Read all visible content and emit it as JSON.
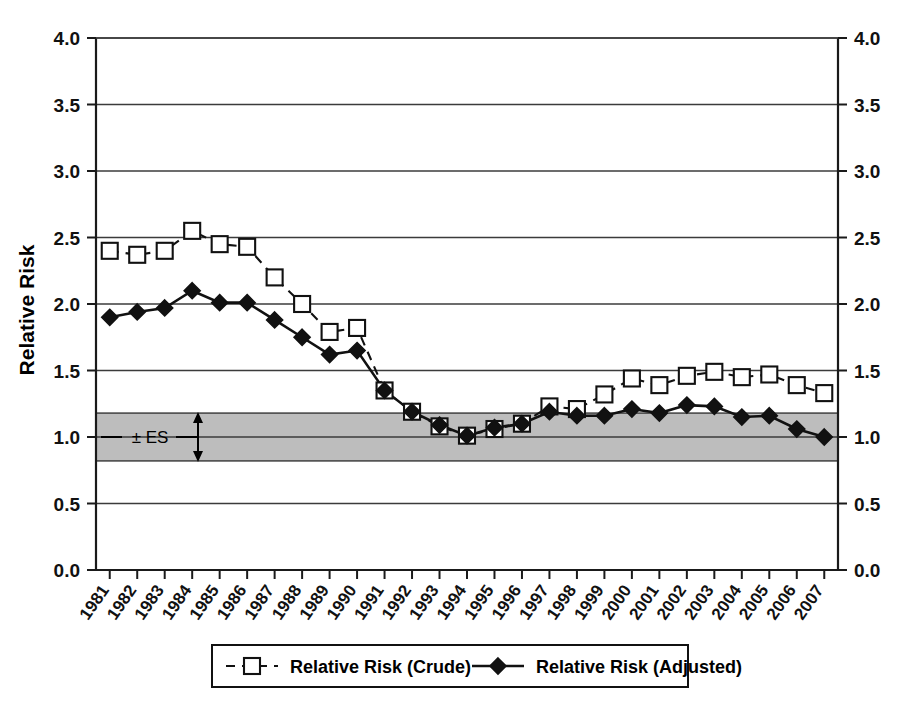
{
  "chart_data": {
    "type": "line",
    "title": "",
    "xlabel": "",
    "ylabel": "Relative Risk",
    "ylim": [
      0.0,
      4.0
    ],
    "ytick_values": [
      0.0,
      0.5,
      1.0,
      1.5,
      2.0,
      2.5,
      3.0,
      3.5,
      4.0
    ],
    "ytick_labels": [
      "0.0",
      "0.5",
      "1.0",
      "1.5",
      "2.0",
      "2.5",
      "3.0",
      "3.5",
      "4.0"
    ],
    "right_axis_labels": [
      "0.0",
      "0.5",
      "1.0",
      "1.5",
      "2.0",
      "2.5",
      "3.0",
      "3.5",
      "4.0"
    ],
    "grid": true,
    "legend_position": "bottom",
    "categories": [
      "1981",
      "1982",
      "1983",
      "1984",
      "1985",
      "1986",
      "1987",
      "1988",
      "1989",
      "1990",
      "1991",
      "1992",
      "1993",
      "1994",
      "1995",
      "1996",
      "1997",
      "1998",
      "1999",
      "2000",
      "2001",
      "2002",
      "2003",
      "2004",
      "2005",
      "2006",
      "2007"
    ],
    "series": [
      {
        "name": "Relative Risk (Crude)",
        "marker": "open-square",
        "linestyle": "dashed",
        "values": [
          2.4,
          2.37,
          2.4,
          2.55,
          2.45,
          2.43,
          2.2,
          2.0,
          1.79,
          1.82,
          1.35,
          1.19,
          1.08,
          1.01,
          1.06,
          1.1,
          1.23,
          1.21,
          1.32,
          1.44,
          1.39,
          1.46,
          1.49,
          1.45,
          1.47,
          1.39,
          1.33
        ]
      },
      {
        "name": "Relative Risk (Adjusted)",
        "marker": "filled-diamond",
        "linestyle": "solid",
        "values": [
          1.9,
          1.94,
          1.97,
          2.1,
          2.01,
          2.01,
          1.88,
          1.75,
          1.62,
          1.65,
          1.35,
          1.19,
          1.09,
          1.01,
          1.07,
          1.1,
          1.19,
          1.16,
          1.16,
          1.21,
          1.18,
          1.24,
          1.23,
          1.15,
          1.16,
          1.06,
          1.0
        ]
      }
    ],
    "annotations": [
      {
        "name": "es-band",
        "label": "± ES",
        "type": "horizontal-band",
        "y_low": 0.82,
        "y_high": 1.18,
        "center": 1.0,
        "fill": "#bdbdbd"
      }
    ]
  },
  "legend": {
    "entries": [
      {
        "label": "Relative Risk (Crude)"
      },
      {
        "label": "Relative Risk (Adjusted)"
      }
    ]
  },
  "colors": {
    "ink": "#111111",
    "band_fill": "#bdbdbd",
    "grid": "#3b3b3b",
    "background": "#ffffff"
  }
}
